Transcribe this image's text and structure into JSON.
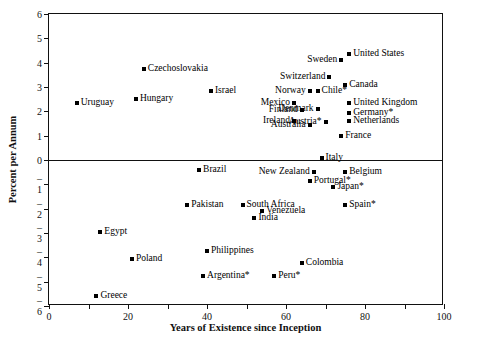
{
  "chart_data": {
    "type": "scatter",
    "title": "",
    "xlabel": "Years of Existence since Inception",
    "ylabel": "Percent per Annum",
    "xlim": [
      0,
      100
    ],
    "ylim": [
      -6,
      6
    ],
    "xticks": [
      0,
      20,
      40,
      60,
      80,
      100
    ],
    "yticks": [
      6,
      5,
      4,
      3,
      2,
      1,
      0,
      -1,
      -2,
      -3,
      -4,
      -5,
      -6
    ],
    "xminor_step": 10,
    "grid": false,
    "legend": "none",
    "zero_line": true,
    "points": [
      {
        "label": "United States",
        "x": 76,
        "y": 4.35,
        "side": "right"
      },
      {
        "label": "Sweden",
        "x": 74,
        "y": 4.1,
        "side": "left"
      },
      {
        "label": "Switzerland",
        "x": 71,
        "y": 3.4,
        "side": "left"
      },
      {
        "label": "Canada",
        "x": 75,
        "y": 3.1,
        "side": "right"
      },
      {
        "label": "Chile*",
        "x": 68,
        "y": 2.85,
        "side": "right"
      },
      {
        "label": "Norway",
        "x": 66,
        "y": 2.85,
        "side": "left"
      },
      {
        "label": "Czechoslovakia",
        "x": 24,
        "y": 3.75,
        "side": "right"
      },
      {
        "label": "Israel",
        "x": 41,
        "y": 2.85,
        "side": "right"
      },
      {
        "label": "Hungary",
        "x": 22,
        "y": 2.5,
        "side": "right"
      },
      {
        "label": "Uruguay",
        "x": 7,
        "y": 2.35,
        "side": "right"
      },
      {
        "label": "United Kingdom",
        "x": 76,
        "y": 2.35,
        "side": "right"
      },
      {
        "label": "Mexico",
        "x": 62,
        "y": 2.35,
        "side": "left"
      },
      {
        "label": "Denmark",
        "x": 68,
        "y": 2.1,
        "side": "left"
      },
      {
        "label": "Finland",
        "x": 64,
        "y": 2.05,
        "side": "left"
      },
      {
        "label": "Germany*",
        "x": 76,
        "y": 1.95,
        "side": "right"
      },
      {
        "label": "Netherlands",
        "x": 76,
        "y": 1.6,
        "side": "right"
      },
      {
        "label": "Austria*",
        "x": 70,
        "y": 1.55,
        "side": "left"
      },
      {
        "label": "Ireland",
        "x": 62,
        "y": 1.6,
        "side": "left"
      },
      {
        "label": "Australia",
        "x": 66,
        "y": 1.45,
        "side": "left"
      },
      {
        "label": "France",
        "x": 74,
        "y": 1.0,
        "side": "right"
      },
      {
        "label": "Italy",
        "x": 69,
        "y": 0.1,
        "side": "right"
      },
      {
        "label": "Brazil",
        "x": 38,
        "y": -0.4,
        "side": "right"
      },
      {
        "label": "Belgium",
        "x": 75,
        "y": -0.5,
        "side": "right"
      },
      {
        "label": "New Zealand",
        "x": 67,
        "y": -0.5,
        "side": "left"
      },
      {
        "label": "Portugal*",
        "x": 66,
        "y": -0.85,
        "side": "right"
      },
      {
        "label": "Japan*",
        "x": 72,
        "y": -1.1,
        "side": "right"
      },
      {
        "label": "Pakistan",
        "x": 35,
        "y": -1.85,
        "side": "right"
      },
      {
        "label": "South Africa",
        "x": 49,
        "y": -1.85,
        "side": "right"
      },
      {
        "label": "Spain*",
        "x": 75,
        "y": -1.85,
        "side": "right"
      },
      {
        "label": "Venezuela",
        "x": 54,
        "y": -2.1,
        "side": "right"
      },
      {
        "label": "India",
        "x": 52,
        "y": -2.4,
        "side": "right"
      },
      {
        "label": "Egypt",
        "x": 13,
        "y": -2.95,
        "side": "right"
      },
      {
        "label": "Philippines",
        "x": 40,
        "y": -3.75,
        "side": "right"
      },
      {
        "label": "Poland",
        "x": 21,
        "y": -4.05,
        "side": "right"
      },
      {
        "label": "Colombia",
        "x": 64,
        "y": -4.25,
        "side": "right"
      },
      {
        "label": "Argentina*",
        "x": 39,
        "y": -4.75,
        "side": "right"
      },
      {
        "label": "Peru*",
        "x": 57,
        "y": -4.75,
        "side": "right"
      },
      {
        "label": "Greece",
        "x": 12,
        "y": -5.6,
        "side": "right"
      }
    ]
  }
}
